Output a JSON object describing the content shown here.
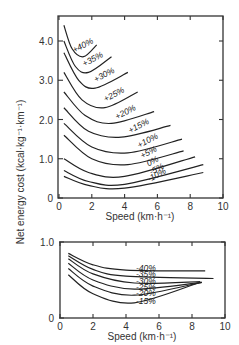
{
  "chart_data": [
    {
      "type": "line",
      "title": "",
      "xlabel": "Speed (km·h⁻¹)",
      "ylabel": "Net energy cost (kcal·kg⁻¹·km⁻¹)",
      "xlim": [
        0,
        10
      ],
      "ylim": [
        0,
        4.5
      ],
      "xticks": [
        0,
        2,
        4,
        6,
        8,
        10
      ],
      "xtick_labels": [
        "0",
        "2",
        "4",
        "6",
        "8",
        "10"
      ],
      "yticks": [
        0,
        1,
        2,
        3,
        4
      ],
      "ytick_labels": [
        "0",
        "1.0",
        "2.0",
        "3.0",
        "4.0"
      ],
      "grid": false,
      "legend": "inline-labels",
      "series": [
        {
          "name": "+40%",
          "x": [
            0.3,
            0.8,
            1.5,
            2.3
          ],
          "y": [
            4.4,
            3.8,
            3.6,
            3.9
          ]
        },
        {
          "name": "+35%",
          "x": [
            0.3,
            1.0,
            1.8,
            3.2
          ],
          "y": [
            4.0,
            3.35,
            3.2,
            3.6
          ]
        },
        {
          "name": "+30%",
          "x": [
            0.3,
            1.2,
            2.2,
            4.2
          ],
          "y": [
            3.7,
            3.0,
            2.8,
            3.2
          ]
        },
        {
          "name": "+25%",
          "x": [
            0.3,
            1.4,
            2.8,
            4.8
          ],
          "y": [
            3.2,
            2.5,
            2.3,
            2.7
          ]
        },
        {
          "name": "+20%",
          "x": [
            0.3,
            1.6,
            3.2,
            5.8
          ],
          "y": [
            2.7,
            2.1,
            1.9,
            2.2
          ]
        },
        {
          "name": "+15%",
          "x": [
            0.3,
            1.8,
            3.8,
            6.8
          ],
          "y": [
            2.3,
            1.7,
            1.55,
            1.85
          ]
        },
        {
          "name": "+10%",
          "x": [
            0.3,
            2.0,
            4.2,
            7.5
          ],
          "y": [
            1.9,
            1.3,
            1.15,
            1.5
          ]
        },
        {
          "name": "+5%",
          "x": [
            0.3,
            2.0,
            4.2,
            7.6
          ],
          "y": [
            1.6,
            1.0,
            0.85,
            1.2
          ]
        },
        {
          "name": "0%",
          "x": [
            0.3,
            1.8,
            4.0,
            8.3
          ],
          "y": [
            1.0,
            0.65,
            0.55,
            1.05
          ]
        },
        {
          "name": "-5%",
          "x": [
            0.3,
            1.8,
            4.0,
            8.8
          ],
          "y": [
            0.7,
            0.42,
            0.35,
            0.85
          ]
        },
        {
          "name": "-10%",
          "x": [
            0.3,
            1.8,
            4.0,
            8.8
          ],
          "y": [
            0.55,
            0.32,
            0.25,
            0.65
          ]
        }
      ]
    },
    {
      "type": "line",
      "title": "",
      "xlabel": "Speed (km·h⁻¹)",
      "ylabel": "Net energy cost (kcal·kg⁻¹·km⁻¹)",
      "xlim": [
        0,
        10
      ],
      "ylim": [
        0,
        1.0
      ],
      "xticks": [
        0,
        2,
        4,
        6,
        8,
        10
      ],
      "xtick_labels": [
        "0",
        "2",
        "4",
        "6",
        "8",
        "10"
      ],
      "yticks": [
        0,
        1.0
      ],
      "ytick_labels": [
        "0",
        "1.0"
      ],
      "grid": false,
      "legend": "inline-labels",
      "series": [
        {
          "name": "-40%",
          "x": [
            0.5,
            2.0,
            4.0,
            8.8
          ],
          "y": [
            0.85,
            0.7,
            0.63,
            0.62
          ]
        },
        {
          "name": "-35%",
          "x": [
            0.5,
            2.0,
            4.0,
            9.3
          ],
          "y": [
            0.82,
            0.64,
            0.55,
            0.52
          ]
        },
        {
          "name": "-30%",
          "x": [
            0.5,
            2.0,
            4.5,
            8.5
          ],
          "y": [
            0.78,
            0.58,
            0.46,
            0.48
          ]
        },
        {
          "name": "-25%",
          "x": [
            0.5,
            2.0,
            4.5,
            8.6
          ],
          "y": [
            0.72,
            0.5,
            0.38,
            0.47
          ]
        },
        {
          "name": "-20%",
          "x": [
            0.5,
            2.0,
            4.5,
            8.6
          ],
          "y": [
            0.65,
            0.42,
            0.3,
            0.47
          ]
        },
        {
          "name": "-15%",
          "x": [
            0.5,
            2.0,
            4.5,
            8.5
          ],
          "y": [
            0.57,
            0.32,
            0.2,
            0.47
          ]
        }
      ]
    }
  ]
}
